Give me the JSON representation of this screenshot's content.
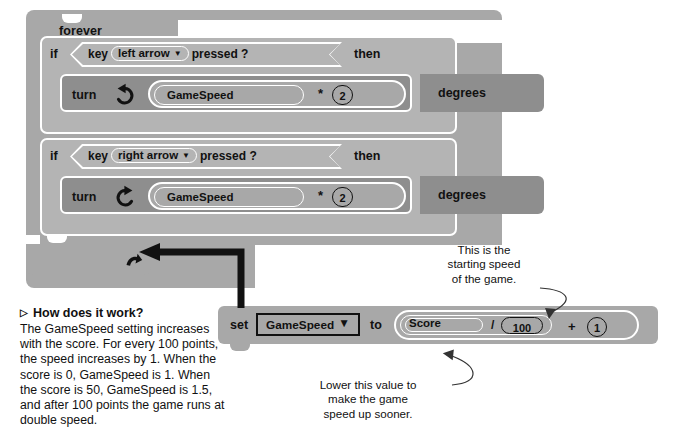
{
  "doc": {
    "title": "Scratch script: forever loop controlling GameSpeed"
  },
  "script": {
    "forever": {
      "label": "forever"
    },
    "branches": [
      {
        "if_label": "if",
        "condition_prefix": "key",
        "condition_value": "left arrow",
        "condition_suffix": "pressed ?",
        "then_label": "then",
        "action_label": "turn",
        "turn_icon": "turn-counterclockwise-icon",
        "operand_variable": "GameSpeed",
        "operator": "*",
        "operand_number": "2",
        "unit_label": "degrees"
      },
      {
        "if_label": "if",
        "condition_prefix": "key",
        "condition_value": "right arrow",
        "condition_suffix": "pressed ?",
        "then_label": "then",
        "action_label": "turn",
        "turn_icon": "turn-clockwise-icon",
        "operand_variable": "GameSpeed",
        "operator": "*",
        "operand_number": "2",
        "unit_label": "degrees"
      }
    ],
    "loop_arrow_icon": "loop-back-arrow-icon"
  },
  "set_block": {
    "set_label": "set",
    "variable": "GameSpeed",
    "dropdown_caret": "▼",
    "to_label": "to",
    "score_variable": "Score",
    "divide_operator": "/",
    "divisor": "100",
    "plus_operator": "+",
    "addend": "1"
  },
  "howto": {
    "marker": "▷",
    "heading": "How does it work?",
    "body": "The GameSpeed setting increases with the score. For every 100 points, the speed increases by 1. When the score is 0, GameSpeed is 1. When the score is 50, GameSpeed is 1.5, and after 100 points the game runs at double speed."
  },
  "annotations": {
    "top": "This is the\nstarting speed\nof the game.",
    "bottom": "Lower this value to\nmake the game\nspeed up sooner."
  },
  "colors": {
    "block_mid": "#a8a8a8",
    "block_dark": "#8e8e8e",
    "block_light": "#b4b4b4",
    "outline": "#ffffff",
    "ink": "#111111",
    "page": "#ffffff"
  }
}
